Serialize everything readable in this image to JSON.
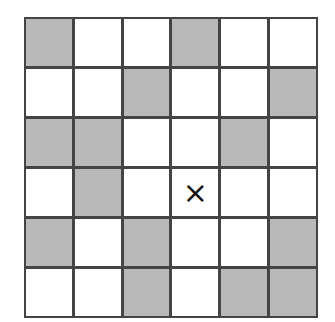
{
  "grid": {
    "rows": 6,
    "cols": 6,
    "colors": {
      "line": "#444444",
      "shaded": "#b9b9b9",
      "empty": "#ffffff",
      "mark": "#111111"
    },
    "cells": [
      [
        "shaded",
        "empty",
        "empty",
        "shaded",
        "empty",
        "empty"
      ],
      [
        "empty",
        "empty",
        "shaded",
        "empty",
        "empty",
        "shaded"
      ],
      [
        "shaded",
        "shaded",
        "empty",
        "empty",
        "shaded",
        "empty"
      ],
      [
        "empty",
        "shaded",
        "empty",
        "marked",
        "empty",
        "empty"
      ],
      [
        "shaded",
        "empty",
        "shaded",
        "empty",
        "empty",
        "shaded"
      ],
      [
        "empty",
        "empty",
        "shaded",
        "empty",
        "shaded",
        "shaded"
      ]
    ],
    "marker": {
      "row": 3,
      "col": 3,
      "symbol": "×",
      "icon": "x-mark-icon"
    }
  }
}
